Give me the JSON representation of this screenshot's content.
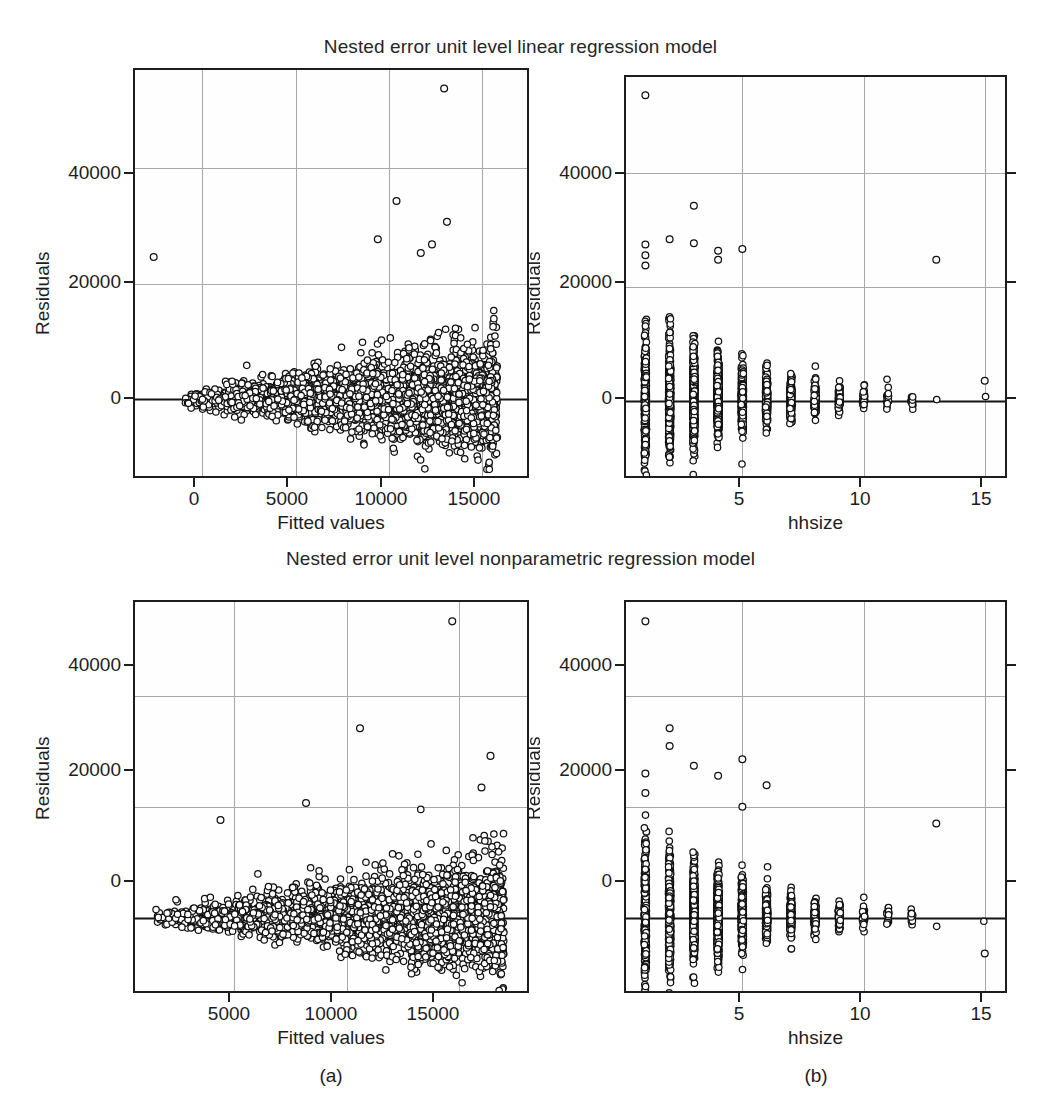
{
  "figure": {
    "width": 1041,
    "height": 1118,
    "background": "#ffffff",
    "marker_style": "open-circle",
    "marker_color": "#111111",
    "grid_color": "#a8a8a8",
    "axis_color": "#1d1d1d"
  },
  "titles": {
    "top": "Nested error unit level linear regression model",
    "bottom": "Nested error unit level nonparametric regression model"
  },
  "captions": {
    "left": "(a)",
    "right": "(b)"
  },
  "chart_data": [
    {
      "id": "panel-a-top",
      "type": "scatter",
      "title": "Nested error unit level linear regression model",
      "xlabel": "Fitted values",
      "ylabel": "Residuals",
      "xticks": [
        0,
        5000,
        10000,
        15000
      ],
      "xticklabels": [
        "0",
        "5000",
        "10000",
        "15000"
      ],
      "yticks": [
        0,
        20000,
        40000
      ],
      "yticklabels": [
        "0",
        "20000",
        "40000"
      ],
      "xlim": [
        -3600,
        17600
      ],
      "ylim": [
        -14000,
        57000
      ],
      "grid": true,
      "reference_line": {
        "y": 0,
        "style": "solid",
        "color": "#141414"
      },
      "n_points": 3200,
      "notes": "Dense wedge-shaped residual cloud widening with fitted values; extreme outlier near (13000, 54000); isolated point near (-2600, 24500).",
      "outliers": [
        {
          "x": 12950,
          "y": 53800
        },
        {
          "x": -2600,
          "y": 24600
        },
        {
          "x": 10400,
          "y": 34300
        },
        {
          "x": 13100,
          "y": 30700
        },
        {
          "x": 9400,
          "y": 27700
        },
        {
          "x": 12300,
          "y": 26800
        },
        {
          "x": 11700,
          "y": 25300
        }
      ]
    },
    {
      "id": "panel-b-top",
      "type": "scatter",
      "title": "Nested error unit level linear regression model",
      "xlabel": "hhsize",
      "ylabel": "Residuals",
      "xticks": [
        5,
        10,
        15
      ],
      "xticklabels": [
        "5",
        "10",
        "15"
      ],
      "yticks": [
        0,
        20000,
        40000
      ],
      "yticklabels": [
        "0",
        "20000",
        "40000"
      ],
      "xlim": [
        0.2,
        16.0
      ],
      "ylim": [
        -14000,
        57000
      ],
      "grid": true,
      "reference_line": {
        "y": 0,
        "style": "solid",
        "color": "#141414"
      },
      "categories": [
        1,
        2,
        3,
        4,
        5,
        6,
        7,
        8,
        9,
        10,
        11,
        12,
        13,
        15
      ],
      "counts": [
        420,
        520,
        610,
        640,
        480,
        310,
        190,
        120,
        70,
        38,
        18,
        12,
        1,
        1
      ],
      "notes": "Residual spread shrinks as hhsize grows; single high outlier at hhsize 1 (~54000); isolated point at hhsize 13 (~25000) and hhsize 15 (~3500)."
    },
    {
      "id": "panel-a-bottom",
      "type": "scatter",
      "title": "Nested error unit level nonparametric regression model",
      "xlabel": "Fitted values",
      "ylabel": "Residuals",
      "xticks": [
        5000,
        10000,
        15000
      ],
      "xticklabels": [
        "5000",
        "10000",
        "15000"
      ],
      "yticks": [
        0,
        20000,
        40000
      ],
      "yticklabels": [
        "0",
        "20000",
        "40000"
      ],
      "xlim": [
        600,
        18200
      ],
      "ylim": [
        -14000,
        57000
      ],
      "grid": true,
      "reference_line": {
        "y": 0,
        "style": "solid",
        "color": "#141414"
      },
      "n_points": 3200,
      "notes": "Similar wedge residual cloud; extreme outlier near (14700, 53500); high points near (10600, 34000) and (16400, 29000).",
      "outliers": [
        {
          "x": 14700,
          "y": 53500
        },
        {
          "x": 10600,
          "y": 34200
        },
        {
          "x": 16400,
          "y": 29200
        },
        {
          "x": 4400,
          "y": 17600
        },
        {
          "x": 16000,
          "y": 23500
        },
        {
          "x": 8200,
          "y": 20700
        }
      ]
    },
    {
      "id": "panel-b-bottom",
      "type": "scatter",
      "title": "Nested error unit level nonparametric regression model",
      "xlabel": "hhsize",
      "ylabel": "Residuals",
      "xticks": [
        5,
        10,
        15
      ],
      "xticklabels": [
        "5",
        "10",
        "15"
      ],
      "yticks": [
        0,
        20000,
        40000
      ],
      "yticklabels": [
        "0",
        "20000",
        "40000"
      ],
      "xlim": [
        0.2,
        16.0
      ],
      "ylim": [
        -14000,
        57000
      ],
      "grid": true,
      "reference_line": {
        "y": 0,
        "style": "solid",
        "color": "#141414"
      },
      "categories": [
        1,
        2,
        3,
        4,
        5,
        6,
        7,
        8,
        9,
        10,
        11,
        12,
        13,
        15
      ],
      "counts": [
        420,
        520,
        610,
        640,
        480,
        310,
        190,
        120,
        70,
        38,
        18,
        12,
        1,
        1
      ],
      "notes": "Residual spread shrinks with hhsize; high outlier at hhsize 1 (~53500); isolated point at hhsize 13 (~17000) and a negative point at hhsize 15 (~-6500)."
    }
  ]
}
